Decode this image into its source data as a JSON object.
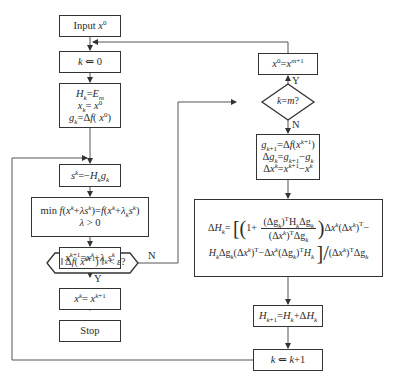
{
  "diagram": {
    "type": "flowchart",
    "left_column": [
      {
        "id": "input",
        "text": "Input x^0"
      },
      {
        "id": "init_k",
        "text": "k ⇐ 0"
      },
      {
        "id": "init_H",
        "lines": [
          "H_k=E_m",
          "x_k=x^0",
          "g_k=Δf(x^0)"
        ]
      },
      {
        "id": "direction",
        "text": "s^k=−H_k g_k"
      },
      {
        "id": "line_search",
        "lines": [
          "min f(x^k+λs^k)=f(x^k+λ_k s^k)",
          "λ > 0"
        ]
      },
      {
        "id": "update_x",
        "text": "x^{k+1}=x^k+λ_k s^k"
      },
      {
        "id": "converge_test",
        "text": "‖ Δf(x^{k+1}) ‖ < ε?",
        "shape": "hexagon"
      },
      {
        "id": "assign_result",
        "text": "x^k= x^{k+1}"
      },
      {
        "id": "stop",
        "text": "Stop"
      }
    ],
    "right_column": [
      {
        "id": "restart",
        "text": "x^0=x^{m+1}"
      },
      {
        "id": "k_eq_m",
        "text": "k=m?",
        "shape": "diamond"
      },
      {
        "id": "gradients",
        "lines": [
          "g_{k+1}=Δf(x^{k+1})",
          "Δg_k=g_{k+1}−g_k",
          "Δx^k=x^{k+1}−x^k"
        ]
      },
      {
        "id": "delta_H",
        "lines": [
          "ΔH_k= [ ( 1+ (Δg_k)^T H_k Δg_k / (Δx^k)^T Δg_k ) Δx^k(Δx^k)^T−",
          "H_k Δg_k(Δx^k)^T−Δx^k(Δg_k)^T H_k ] / (Δx^k)^T Δg_k"
        ]
      },
      {
        "id": "update_H",
        "text": "H_{k+1}=H_k+ΔH_k"
      },
      {
        "id": "increment_k",
        "text": "k ⇐ k+1"
      }
    ],
    "labels": {
      "converge_no": "N",
      "converge_yes": "Y",
      "k_eq_m_yes": "Y",
      "k_eq_m_no": "N"
    }
  }
}
